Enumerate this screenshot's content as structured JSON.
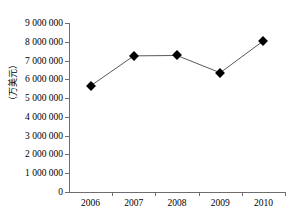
{
  "chart_data": {
    "type": "line",
    "title": "",
    "subtitle": "",
    "xlabel": "",
    "ylabel": "（万美元）",
    "categories": [
      "2006",
      "2007",
      "2008",
      "2009",
      "2010"
    ],
    "values": [
      5650000,
      7250000,
      7270000,
      6350000,
      8050000
    ],
    "series": [
      {
        "name": "",
        "values": [
          5650000,
          7250000,
          7270000,
          6350000,
          8050000
        ]
      }
    ],
    "ylim": [
      0,
      9000000
    ],
    "ytick_values": [
      0,
      1000000,
      2000000,
      3000000,
      4000000,
      5000000,
      6000000,
      7000000,
      8000000,
      9000000
    ],
    "ytick_labels": [
      "0",
      "1 000 000",
      "2 000 000",
      "3 000 000",
      "4 000 000",
      "5 000 000",
      "6 000 000",
      "7 000 000",
      "8 000 000",
      "9 000 000"
    ],
    "xtick_labels": [
      "2006",
      "2007",
      "2008",
      "2009",
      "2010"
    ],
    "grid": false,
    "legend": false,
    "legend_position": "none",
    "marker": "diamond",
    "marker_color": "#000000",
    "line_color": "#595959",
    "axis_color": "#6e6e6e",
    "background_color": "#ffffff",
    "annotations": []
  }
}
